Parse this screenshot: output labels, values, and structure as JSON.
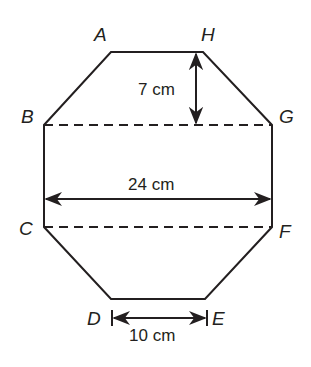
{
  "diagram": {
    "shape": "octagon",
    "vertices": {
      "A": {
        "label": "A",
        "x": 111,
        "y": 52
      },
      "H": {
        "label": "H",
        "x": 203,
        "y": 52
      },
      "G": {
        "label": "G",
        "x": 272,
        "y": 125
      },
      "F": {
        "label": "F",
        "x": 272,
        "y": 227
      },
      "E": {
        "label": "E",
        "x": 205,
        "y": 299
      },
      "D": {
        "label": "D",
        "x": 111,
        "y": 299
      },
      "C": {
        "label": "C",
        "x": 44,
        "y": 227
      },
      "B": {
        "label": "B",
        "x": 44,
        "y": 125
      }
    },
    "dashed_lines": [
      {
        "from": "B",
        "to": "G"
      },
      {
        "from": "C",
        "to": "F"
      }
    ],
    "measurements": {
      "height_top": {
        "label": "7 cm",
        "from": "H",
        "to": "line BG"
      },
      "width": {
        "label": "24 cm",
        "from": "BC",
        "to": "GF"
      },
      "bottom": {
        "label": "10 cm",
        "from": "D",
        "to": "E"
      }
    },
    "colors": {
      "stroke": "#231f20",
      "background": "#ffffff"
    }
  }
}
